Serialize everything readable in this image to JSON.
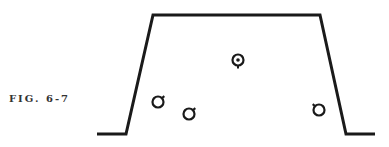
{
  "figure": {
    "caption": "FIG. 6-7",
    "stroke_color": "#1a1a1a",
    "background": "#ffffff",
    "outline": {
      "points": [
        [
          97,
          134
        ],
        [
          126,
          134
        ],
        [
          153,
          15
        ],
        [
          320,
          15
        ],
        [
          346,
          134
        ],
        [
          375,
          134
        ]
      ]
    },
    "symbols": [
      {
        "type": "target",
        "cx": 238,
        "cy": 60,
        "r": 5.5,
        "tick": "down"
      },
      {
        "type": "ring",
        "cx": 158,
        "cy": 102,
        "r": 5.5,
        "tick": "up-right"
      },
      {
        "type": "ring",
        "cx": 189,
        "cy": 114,
        "r": 5.5,
        "tick": "up-right"
      },
      {
        "type": "ring",
        "cx": 319,
        "cy": 110,
        "r": 5.5,
        "tick": "up-left"
      }
    ]
  }
}
